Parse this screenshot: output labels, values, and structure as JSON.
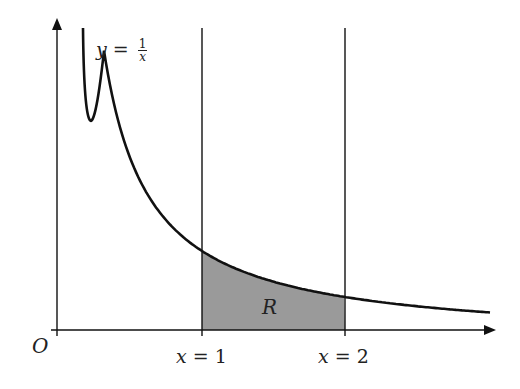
{
  "diagram": {
    "curve_label": {
      "lhs": "y",
      "eq": "=",
      "num": "1",
      "den": "x"
    },
    "origin_label": "O",
    "line1_label": {
      "var": "x",
      "eq": "=",
      "val": "1"
    },
    "line2_label": {
      "var": "x",
      "eq": "=",
      "val": "2"
    },
    "region_label": "R",
    "colors": {
      "stroke": "#111111",
      "region_fill": "#9a9a9a",
      "background": "#ffffff"
    },
    "geometry": {
      "origin_px": [
        57,
        330
      ],
      "x_axis_end_px": 496,
      "y_axis_top_px": 18,
      "x1_px": 202,
      "x2_px": 345,
      "vline_top_px": 28,
      "curve": {
        "a": 92,
        "c": -13,
        "x0_px": 59,
        "unit_px": 143,
        "start_px": 83,
        "end_px": 490
      }
    }
  }
}
